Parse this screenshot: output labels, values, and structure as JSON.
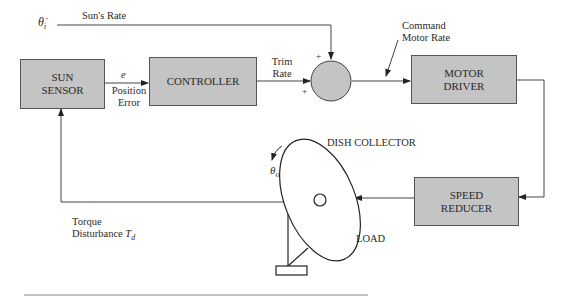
{
  "blocks": {
    "sun_sensor": {
      "line1": "SUN",
      "line2": "SENSOR"
    },
    "controller": {
      "label": "CONTROLLER"
    },
    "motor_driver": {
      "line1": "MOTOR",
      "line2": "DRIVER"
    },
    "speed_reducer": {
      "line1": "SPEED",
      "line2": "REDUCER"
    }
  },
  "signals": {
    "input_symbol": "θ̇",
    "input_subscript": "i",
    "suns_rate": "Sun's Rate",
    "error_symbol": "e",
    "position_error_line1": "Position",
    "position_error_line2": "Error",
    "trim_rate_line1": "Trim",
    "trim_rate_line2": "Rate",
    "command_line1": "Command",
    "command_line2": "Motor Rate",
    "plus_top": "+",
    "plus_bottom": "+",
    "output_symbol": "θ",
    "output_subscript": "o",
    "torque_line1": "Torque",
    "torque_line2": "Disturbance",
    "torque_symbol": "T",
    "torque_subscript": "d"
  },
  "plant": {
    "dish_label": "DISH COLLECTOR",
    "load_label": "LOAD"
  },
  "colors": {
    "block_fill": "#c4c4c4",
    "line": "#444444"
  }
}
